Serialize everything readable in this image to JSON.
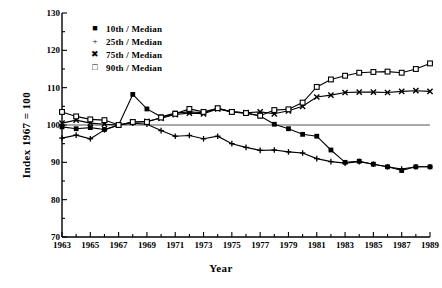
{
  "figure": {
    "title_partial": "",
    "ylabel": "Index  1967 = 100",
    "xlabel": "Year"
  },
  "legend": [
    {
      "marker": "filled-square",
      "glyph": "■",
      "label": "10th / Median"
    },
    {
      "marker": "plus",
      "glyph": "+",
      "label": "25th / Median"
    },
    {
      "marker": "cross",
      "glyph": "✖",
      "label": "75th / Median"
    },
    {
      "marker": "open-square",
      "glyph": "□",
      "label": "90th / Median"
    }
  ],
  "axes": {
    "y_ticks": [
      130,
      120,
      110,
      100,
      90,
      80,
      70
    ],
    "y_tick_labels": [
      "130",
      "120",
      "110",
      "100",
      "90",
      "80",
      "70"
    ],
    "x_ticks": [
      1963,
      1965,
      1967,
      1969,
      1971,
      1973,
      1975,
      1977,
      1979,
      1981,
      1983,
      1985,
      1987,
      1989
    ],
    "x_tick_labels": [
      "1963",
      "1965",
      "1967",
      "1969",
      "1971",
      "1973",
      "1975",
      "1977",
      "1979",
      "1981",
      "1983",
      "1985",
      "1987",
      "1989"
    ]
  },
  "chart_data": {
    "type": "line",
    "title": "",
    "xlabel": "Year",
    "ylabel": "Index  1967 = 100",
    "xlim": [
      1963,
      1989
    ],
    "ylim": [
      70,
      130
    ],
    "grid": false,
    "legend_position": "upper-left",
    "reference_line": 100,
    "x": [
      1963,
      1964,
      1965,
      1966,
      1967,
      1968,
      1969,
      1970,
      1971,
      1972,
      1973,
      1974,
      1975,
      1976,
      1977,
      1978,
      1979,
      1980,
      1981,
      1982,
      1983,
      1984,
      1985,
      1986,
      1987,
      1988,
      1989
    ],
    "series": [
      {
        "name": "10th / Median",
        "marker": "filled-square",
        "values": [
          99.5,
          99.0,
          99.3,
          98.8,
          100.0,
          108.2,
          104.3,
          102.2,
          103.2,
          103.5,
          103.3,
          104.5,
          103.5,
          103.2,
          102.4,
          100.2,
          99.0,
          97.5,
          97.0,
          93.3,
          90.0,
          90.3,
          89.5,
          88.8,
          87.8,
          88.8,
          88.8
        ]
      },
      {
        "name": "25th / Median",
        "marker": "plus",
        "values": [
          96.5,
          97.3,
          96.3,
          98.7,
          100.0,
          100.5,
          100.2,
          98.5,
          97.0,
          97.2,
          96.3,
          97.0,
          95.0,
          94.0,
          93.2,
          93.3,
          92.8,
          92.5,
          91.0,
          90.2,
          89.8,
          90.2,
          89.5,
          88.8,
          88.2,
          88.8,
          88.8
        ]
      },
      {
        "name": "75th / Median",
        "marker": "cross",
        "values": [
          100.5,
          101.3,
          100.5,
          100.2,
          100.0,
          100.8,
          101.0,
          101.8,
          102.8,
          103.2,
          103.0,
          104.3,
          103.5,
          103.3,
          103.5,
          103.0,
          103.8,
          105.0,
          107.5,
          108.0,
          108.7,
          108.8,
          108.8,
          108.7,
          109.0,
          109.2,
          109.0
        ]
      },
      {
        "name": "90th / Median",
        "marker": "open-square",
        "values": [
          103.5,
          102.3,
          101.5,
          101.3,
          100.0,
          100.8,
          100.8,
          102.0,
          103.0,
          104.3,
          103.5,
          104.5,
          103.5,
          103.2,
          102.5,
          104.0,
          104.2,
          106.0,
          110.2,
          112.2,
          113.2,
          114.0,
          114.2,
          114.3,
          114.0,
          115.0,
          116.5
        ]
      }
    ]
  }
}
